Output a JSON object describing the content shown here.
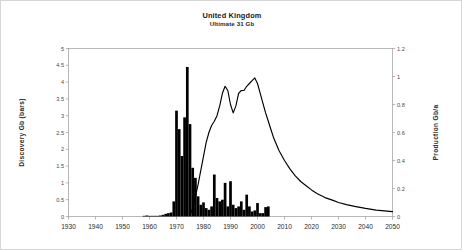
{
  "figure": {
    "title": "United Kingdom",
    "subtitle": "Ultimate  31 Gb",
    "background": "#ffffff",
    "frame_color": "#9a9a9a",
    "series_color": "#000000"
  },
  "chart_data": {
    "type": "bar",
    "title": "United Kingdom",
    "subtitle": "Ultimate  31 Gb",
    "xlabel": "",
    "ylabel": "Discovery Gb (bars)",
    "y2label": "Production Gb/a",
    "xlim": [
      1930,
      2050
    ],
    "ylim": [
      0,
      5
    ],
    "y2lim": [
      0,
      1.2
    ],
    "grid": false,
    "legend": null,
    "xticks": [
      1930,
      1940,
      1950,
      1960,
      1970,
      1980,
      1990,
      2000,
      2010,
      2020,
      2030,
      2040,
      2050
    ],
    "xtick_labels": [
      "1930",
      "1940",
      "1950",
      "1960",
      "1970",
      "1980",
      "1990",
      "2000",
      "2010",
      "2020",
      "2030",
      "2040",
      "2050"
    ],
    "yticks": [
      0,
      0.5,
      1,
      1.5,
      2,
      2.5,
      3,
      3.5,
      4,
      4.5,
      5
    ],
    "ytick_labels": [
      "0",
      "0.5",
      "1",
      "1.5",
      "2",
      "2.5",
      "3",
      "3.5",
      "4",
      "4.5",
      "5"
    ],
    "y2ticks": [
      0,
      0.2,
      0.4,
      0.6,
      0.8,
      1,
      1.2
    ],
    "y2tick_labels": [
      "0",
      "0.2",
      "0.4",
      "0.6",
      "0.8",
      "1",
      "1.2"
    ],
    "series": [
      {
        "name": "Discovery Gb (bars)",
        "type": "bar",
        "axis": "left",
        "color": "#000000",
        "x": [
          1958,
          1959,
          1960,
          1961,
          1962,
          1963,
          1964,
          1965,
          1966,
          1967,
          1968,
          1969,
          1970,
          1971,
          1972,
          1973,
          1974,
          1975,
          1976,
          1977,
          1978,
          1979,
          1980,
          1981,
          1982,
          1983,
          1984,
          1985,
          1986,
          1987,
          1988,
          1989,
          1990,
          1991,
          1992,
          1993,
          1994,
          1995,
          1996,
          1997,
          1998,
          1999,
          2000,
          2001,
          2002,
          2003,
          2004
        ],
        "values": [
          0.02,
          0.03,
          0.02,
          0.02,
          0.02,
          0.02,
          0.03,
          0.05,
          0.08,
          0.1,
          0.12,
          0.45,
          3.15,
          2.6,
          1.8,
          2.95,
          4.45,
          2.75,
          1.45,
          1.15,
          0.6,
          0.35,
          0.42,
          0.25,
          0.2,
          0.3,
          1.25,
          0.55,
          0.45,
          0.5,
          1.0,
          0.3,
          1.05,
          0.35,
          0.25,
          0.3,
          0.45,
          0.2,
          0.65,
          0.3,
          0.15,
          0.18,
          0.4,
          0.1,
          0.1,
          0.28,
          0.3
        ]
      },
      {
        "name": "Production Gb/a",
        "type": "line",
        "axis": "right",
        "color": "#000000",
        "x": [
          1975,
          1976,
          1977,
          1978,
          1979,
          1980,
          1981,
          1982,
          1983,
          1984,
          1985,
          1986,
          1987,
          1988,
          1989,
          1990,
          1991,
          1992,
          1993,
          1994,
          1995,
          1996,
          1997,
          1998,
          1999,
          2000,
          2001,
          2002,
          2003,
          2004,
          2005,
          2006,
          2008,
          2010,
          2012,
          2014,
          2016,
          2018,
          2020,
          2022,
          2025,
          2028,
          2030,
          2033,
          2036,
          2040,
          2044,
          2047,
          2050
        ],
        "values": [
          0.01,
          0.06,
          0.14,
          0.23,
          0.33,
          0.43,
          0.53,
          0.6,
          0.65,
          0.68,
          0.72,
          0.79,
          0.88,
          0.93,
          0.9,
          0.8,
          0.74,
          0.79,
          0.88,
          0.9,
          0.9,
          0.93,
          0.95,
          0.97,
          0.99,
          0.95,
          0.88,
          0.81,
          0.74,
          0.68,
          0.62,
          0.56,
          0.47,
          0.4,
          0.34,
          0.29,
          0.25,
          0.22,
          0.19,
          0.165,
          0.135,
          0.115,
          0.1,
          0.085,
          0.072,
          0.058,
          0.046,
          0.04,
          0.035
        ]
      }
    ]
  }
}
